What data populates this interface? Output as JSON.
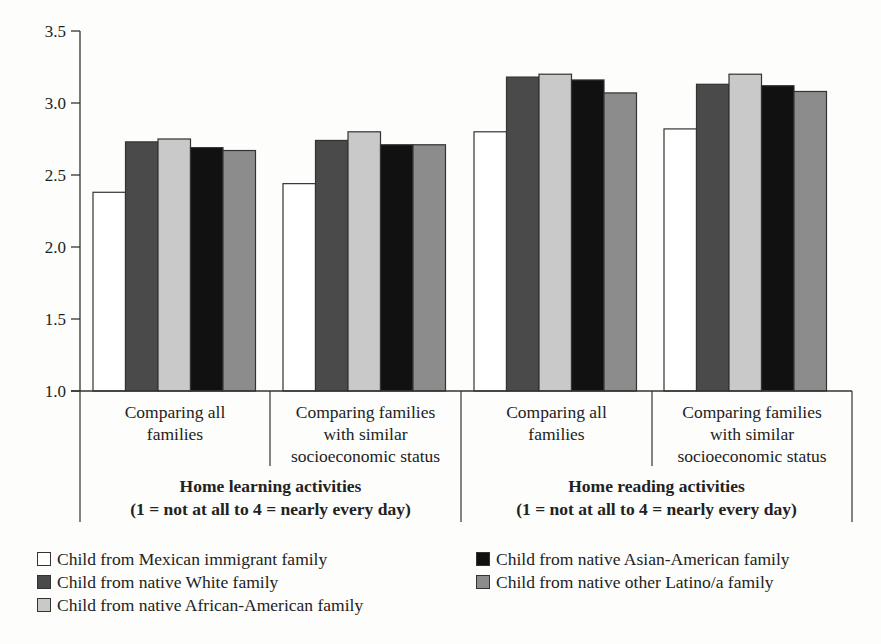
{
  "chart_data": {
    "type": "bar",
    "title": "",
    "xlabel": "",
    "ylabel": "",
    "ylim": [
      1.0,
      3.5
    ],
    "yticks": [
      "1.0",
      "1.5",
      "2.0",
      "2.5",
      "3.0",
      "3.5"
    ],
    "grid": false,
    "legend_position": "bottom",
    "categories": [
      "Home learning activities — Comparing all families",
      "Home learning activities — Comparing families with similar socioeconomic status",
      "Home reading activities — Comparing all families",
      "Home reading activities — Comparing families with similar socioeconomic status"
    ],
    "category_labels": [
      [
        "Comparing all",
        "families"
      ],
      [
        "Comparing families",
        "with similar",
        "socioeconomic status"
      ],
      [
        "Comparing all",
        "families"
      ],
      [
        "Comparing families",
        "with similar",
        "socioeconomic status"
      ]
    ],
    "groups": [
      {
        "title": "Home learning activities",
        "subtitle": "(1 = not at all to 4 = nearly every day)"
      },
      {
        "title": "Home reading activities",
        "subtitle": "(1 = not at all to 4 = nearly every day)"
      }
    ],
    "series": [
      {
        "name": "Child from Mexican immigrant family",
        "color": "#ffffff",
        "values": [
          2.38,
          2.44,
          2.8,
          2.82
        ]
      },
      {
        "name": "Child from native White family",
        "color": "#4a4a4a",
        "values": [
          2.73,
          2.74,
          3.18,
          3.13
        ]
      },
      {
        "name": "Child from native African-American family",
        "color": "#c9c9c9",
        "values": [
          2.75,
          2.8,
          3.2,
          3.2
        ]
      },
      {
        "name": "Child from native Asian-American family",
        "color": "#111111",
        "values": [
          2.69,
          2.71,
          3.16,
          3.12
        ]
      },
      {
        "name": "Child from native other Latino/a family",
        "color": "#8c8c8c",
        "values": [
          2.67,
          2.71,
          3.07,
          3.08
        ]
      }
    ]
  }
}
